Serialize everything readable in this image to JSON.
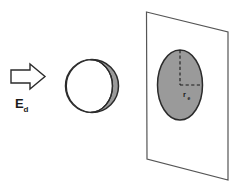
{
  "figure": {
    "background_color": "#ffffff",
    "stroke_color": "#333333",
    "shade_color": "#999999"
  },
  "arrow": {
    "name": "incident-beam-arrow",
    "direction": "right",
    "fill_color": "#ffffff",
    "stroke_color": "#2b2b2b",
    "label_main": "E",
    "label_subscript": "d",
    "label_full": "Ed"
  },
  "sphere": {
    "name": "sphere",
    "front_face_color": "#ffffff",
    "shaded_crescent_color": "#9a9a9a",
    "outline_color": "#2b2b2b"
  },
  "plane": {
    "name": "projection-plane",
    "fill_color": "#ffffff",
    "outline_color": "#555555"
  },
  "projected_disc": {
    "name": "projected-disc",
    "fill_color": "#9a9a9a",
    "outline_color": "#2b2b2b",
    "radius_label_main": "r",
    "radius_label_subscript": "e",
    "radius_label_full": "re",
    "dashed_lines": [
      "vertical-radius",
      "horizontal-radius"
    ],
    "dash_color": "#1a1a1a"
  }
}
